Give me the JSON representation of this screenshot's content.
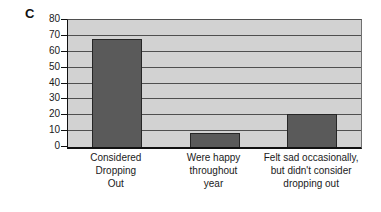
{
  "panel_label": "C",
  "chart_data": {
    "type": "bar",
    "title": "",
    "xlabel": "",
    "ylabel": "",
    "categories": [
      "Considered\nDropping\nOut",
      "Were happy\nthroughout\nyear",
      "Felt sad occasionally,\nbut didn't consider\ndropping out"
    ],
    "values": [
      68,
      9,
      21
    ],
    "ylim": [
      0,
      80
    ],
    "ytick_step": 10,
    "ytick_labels": [
      "0",
      "10",
      "20",
      "30",
      "40",
      "50",
      "60",
      "70",
      "80"
    ],
    "grid": true,
    "legend": "none",
    "colors": {
      "bar_fill": "#5a5a5a",
      "bar_border": "#262626",
      "plot_background": "#d2d2d2",
      "gridline": "#4f4f4f",
      "axis": "#111111",
      "text": "#1a1a1a",
      "page_background": "#ffffff"
    }
  }
}
